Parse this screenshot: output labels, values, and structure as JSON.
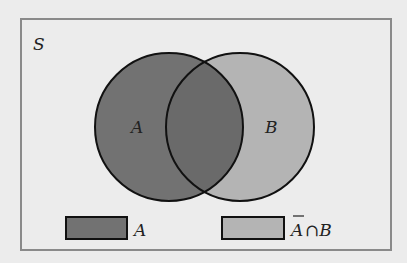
{
  "diagram": {
    "universe_label": "S",
    "sets": [
      {
        "label": "A",
        "color": "#727272"
      },
      {
        "label": "B",
        "color": "#b4b4b4"
      }
    ],
    "legend": [
      {
        "label": "A",
        "color": "#727272"
      },
      {
        "label_bar": "A",
        "label_rest": "∩B",
        "color": "#b4b4b4"
      }
    ],
    "colors": {
      "background": "#ececec",
      "frame": "#8a8a8a",
      "stroke": "#111111"
    }
  }
}
